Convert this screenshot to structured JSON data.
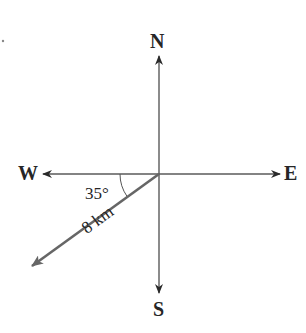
{
  "diagram": {
    "type": "compass-bearing",
    "directions": {
      "north": "N",
      "south": "S",
      "east": "E",
      "west": "W"
    },
    "vector": {
      "distance_label": "8 km",
      "angle_label": "35°",
      "angle_degrees": 35,
      "reference_axis": "W",
      "direction": "south of west"
    },
    "colors": {
      "axes": "#5a5a5a",
      "vector": "#666666",
      "text": "#262626"
    }
  }
}
